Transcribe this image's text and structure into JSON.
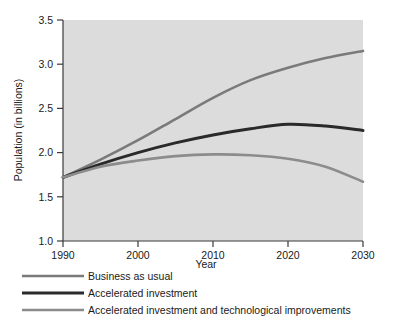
{
  "chart_data": {
    "type": "line",
    "title": "",
    "xlabel": "Year",
    "ylabel": "Population (in billions)",
    "xlim": [
      1990,
      2030
    ],
    "ylim": [
      1.0,
      3.5
    ],
    "xticks": [
      1990,
      2000,
      2010,
      2020,
      2030
    ],
    "xtick_labels": [
      "1990",
      "2000",
      "2010",
      "2020",
      "2030"
    ],
    "yticks": [
      1.0,
      1.5,
      2.0,
      2.5,
      3.0,
      3.5
    ],
    "ytick_labels": [
      "1.0",
      "1.5",
      "2.0",
      "2.5",
      "3.0",
      "3.5"
    ],
    "grid": false,
    "legend_position": "below-axes-left",
    "plot_background": "#dcdcdc",
    "figure_background": "#ffffff",
    "x": [
      1990,
      1995,
      2000,
      2005,
      2010,
      2015,
      2020,
      2025,
      2030
    ],
    "series": [
      {
        "name": "Business as usual",
        "color": "#7a7a7a",
        "line_width": 2.6,
        "values": [
          1.72,
          1.92,
          2.14,
          2.38,
          2.62,
          2.82,
          2.96,
          3.07,
          3.15
        ]
      },
      {
        "name": "Accelerated investment",
        "color": "#2a2a2a",
        "line_width": 3.0,
        "values": [
          1.72,
          1.87,
          2.0,
          2.11,
          2.2,
          2.27,
          2.32,
          2.3,
          2.25
        ]
      },
      {
        "name": "Accelerated investment and technological improvements",
        "color": "#8c8c8c",
        "line_width": 2.6,
        "values": [
          1.72,
          1.84,
          1.91,
          1.96,
          1.98,
          1.97,
          1.93,
          1.84,
          1.67
        ]
      }
    ]
  },
  "legend": {
    "items": [
      {
        "label": "Business as usual",
        "color": "#7a7a7a",
        "line_width": 2.6
      },
      {
        "label": "Accelerated investment",
        "color": "#2a2a2a",
        "line_width": 3.0
      },
      {
        "label": "Accelerated investment and technological improvements",
        "color": "#8c8c8c",
        "line_width": 2.6
      }
    ]
  },
  "axes": {
    "x_title": "Year",
    "y_title": "Population (in billions)"
  }
}
